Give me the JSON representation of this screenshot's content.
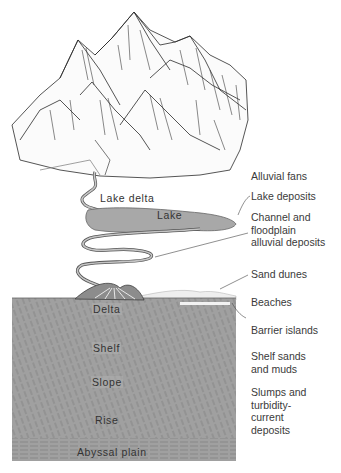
{
  "figure": {
    "colors": {
      "background": "#ffffff",
      "sea": "#9e9e9e",
      "lake": "#a8a8a8",
      "ink": "#2a2a2a",
      "label_text": "#3a3a3a"
    }
  },
  "inline_labels": {
    "lake_delta": "Lake delta",
    "lake": "Lake",
    "delta": "Delta",
    "shelf": "Shelf",
    "slope": "Slope",
    "rise": "Rise",
    "abyssal_plain": "Abyssal plain"
  },
  "side_labels": {
    "alluvial_fans": "Alluvial fans",
    "lake_deposits": "Lake deposits",
    "channel_1": "Channel and",
    "channel_2": "floodplain",
    "channel_3": "alluvial deposits",
    "sand_dunes": "Sand dunes",
    "beaches": "Beaches",
    "barrier_islands": "Barrier islands",
    "shelf_1": "Shelf sands",
    "shelf_2": "and muds",
    "slumps_1": "Slumps and",
    "slumps_2": "turbidity-",
    "slumps_3": "current",
    "slumps_4": "deposits"
  }
}
